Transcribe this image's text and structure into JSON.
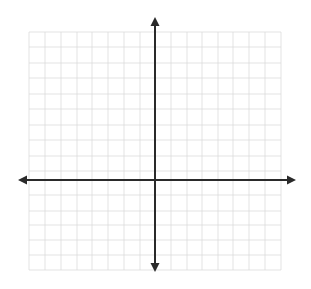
{
  "diagram": {
    "type": "coordinate-plane",
    "background": "#ffffff",
    "grid": {
      "color": "#dcdcdc",
      "stroke_width": 0.8,
      "x_lines": [
        29,
        45,
        61,
        77,
        92,
        108,
        124,
        140,
        171,
        187,
        202,
        218,
        233,
        249,
        265,
        281
      ],
      "y_lines": [
        32,
        47,
        63,
        78,
        94,
        109,
        125,
        140,
        156,
        171,
        195,
        211,
        225,
        240,
        255,
        270
      ],
      "left": 29,
      "right": 281,
      "top": 32,
      "bottom": 270
    },
    "axes": {
      "color": "#2a2a2a",
      "stroke_width": 2,
      "x_axis": {
        "y": 180,
        "x_start": 26,
        "x_end": 288,
        "arrow_left_tip": 18,
        "arrow_right_tip": 296
      },
      "y_axis": {
        "x": 155,
        "y_start": 26,
        "y_end": 264,
        "arrow_top_tip": 17,
        "arrow_bottom_tip": 272
      }
    },
    "icons": {
      "arrow_up": "arrow-up-icon",
      "arrow_down": "arrow-down-icon",
      "arrow_left": "arrow-left-icon",
      "arrow_right": "arrow-right-icon"
    }
  }
}
